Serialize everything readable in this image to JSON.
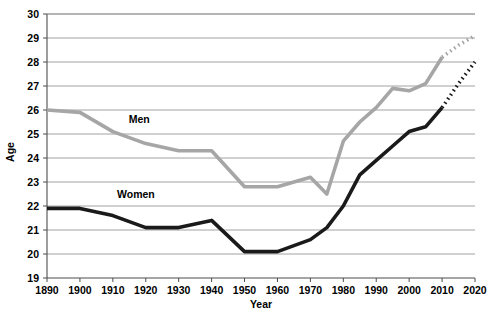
{
  "chart_data": {
    "type": "line",
    "title": "",
    "xlabel": "Year",
    "ylabel": "Age",
    "xlim": [
      1890,
      2020
    ],
    "ylim": [
      19,
      30
    ],
    "grid": true,
    "legend": "inline-labels",
    "x_ticks": [
      "1890",
      "1900",
      "1910",
      "1920",
      "1930",
      "1940",
      "1950",
      "1960",
      "1970",
      "1980",
      "1990",
      "2000",
      "2010",
      "2020"
    ],
    "y_ticks": [
      "19",
      "20",
      "21",
      "22",
      "23",
      "24",
      "25",
      "26",
      "27",
      "28",
      "29",
      "30"
    ],
    "series": [
      {
        "name": "Men",
        "label": "Men",
        "color": "#a6a6a6",
        "label_x": 1918,
        "label_y": 25.45,
        "solid": {
          "x": [
            1890,
            1900,
            1910,
            1920,
            1930,
            1940,
            1950,
            1960,
            1970,
            1975,
            1980,
            1985,
            1990,
            1995,
            2000,
            2005,
            2010
          ],
          "y": [
            26.0,
            25.9,
            25.1,
            24.6,
            24.3,
            24.3,
            22.8,
            22.8,
            23.2,
            22.5,
            24.7,
            25.5,
            26.1,
            26.9,
            26.8,
            27.1,
            28.2
          ]
        },
        "dashed": {
          "x": [
            2010,
            2015,
            2020
          ],
          "y": [
            28.2,
            28.7,
            29.1
          ]
        }
      },
      {
        "name": "Women",
        "label": "Women",
        "color": "#1a1a1a",
        "label_x": 1917,
        "label_y": 22.35,
        "solid": {
          "x": [
            1890,
            1900,
            1910,
            1920,
            1930,
            1940,
            1950,
            1960,
            1970,
            1975,
            1980,
            1985,
            1990,
            1995,
            2000,
            2005,
            2010
          ],
          "y": [
            21.9,
            21.9,
            21.6,
            21.1,
            21.1,
            21.4,
            20.1,
            20.1,
            20.6,
            21.1,
            22.0,
            23.3,
            23.9,
            24.5,
            25.1,
            25.3,
            26.1
          ]
        },
        "dashed": {
          "x": [
            2010,
            2015,
            2020
          ],
          "y": [
            26.1,
            27.1,
            28.0
          ]
        }
      }
    ]
  },
  "plot": {
    "left": 47,
    "right": 475,
    "top": 14,
    "bottom": 278
  }
}
